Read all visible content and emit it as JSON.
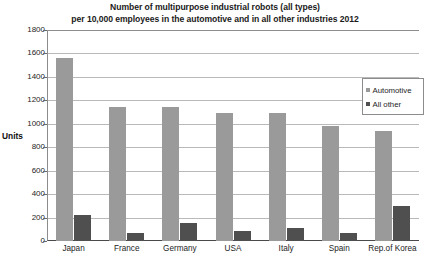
{
  "chart_data": {
    "type": "bar",
    "title": "Number of multipurpose industrial robots (all types) per 10,000 employees in the automotive and in all other industries 2012",
    "title_lines": [
      "Number of multipurpose industrial robots (all types)",
      "per 10,000 employees in the automotive and in all other industries 2012"
    ],
    "xlabel": "",
    "ylabel": "Units",
    "ylim": [
      0,
      1800
    ],
    "ytick_step": 200,
    "yticks": [
      1800,
      1600,
      1400,
      1200,
      1000,
      800,
      600,
      400,
      200,
      0
    ],
    "grid": true,
    "legend_position": "inside-top-right",
    "categories": [
      "Japan",
      "France",
      "Germany",
      "USA",
      "Italy",
      "Spain",
      "Rep.of Korea"
    ],
    "series": [
      {
        "name": "Automotive",
        "color": "#9a9a9a",
        "values": [
          1560,
          1140,
          1140,
          1090,
          1090,
          980,
          940
        ]
      },
      {
        "name": "All other",
        "color": "#4f4f4f",
        "values": [
          220,
          65,
          150,
          85,
          110,
          70,
          300
        ]
      }
    ]
  }
}
